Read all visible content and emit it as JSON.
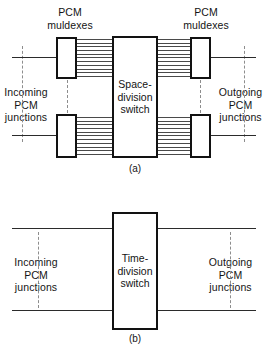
{
  "figure": {
    "background": "#ffffff",
    "line_color": "#2b2b2b",
    "box_border_color": "#121212",
    "dash_color": "#8d8d8d",
    "width": 267,
    "height": 349
  },
  "panel_a": {
    "caption": "(a)",
    "muldex_label_left": "PCM\nmuldexes",
    "muldex_label_right": "PCM\nmuldexes",
    "switch_label": "Space-\ndivision\nswitch",
    "incoming_label": "Incoming\nPCM\njunctions",
    "outgoing_label": "Outgoing\nPCM\njunctions",
    "muldex_count": 4,
    "bundle_line_count": 11
  },
  "panel_b": {
    "caption": "(b)",
    "switch_label": "Time-\ndivision\nswitch",
    "incoming_label": "Incoming\nPCM\njunctions",
    "outgoing_label": "Outgoing\nPCM\njunctions",
    "junction_line_count": 2
  }
}
